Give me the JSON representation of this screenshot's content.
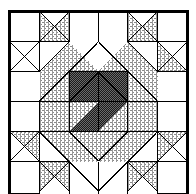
{
  "figure": {
    "kind": "quilt-block-diagram",
    "canvas": {
      "width": 196,
      "height": 194
    },
    "frame": {
      "x": 8,
      "y": 10,
      "width": 180,
      "height": 184,
      "stroke": "#000000",
      "stroke_width": 3
    },
    "grid": {
      "columns": 6,
      "rows": 6,
      "cell": 30,
      "origin_x": 9.5,
      "origin_y": 11.5
    },
    "palette": {
      "background": "#ffffff",
      "patch_white": "#ffffff",
      "patch_light": "#c9c9c9",
      "patch_dark": "#3a3a3a",
      "outline": "#000000"
    },
    "fill_names": {
      "white": "patch-white",
      "light": "patch-light-crosshatch",
      "dark": "patch-dark-checker"
    },
    "symmetry": "4-fold rotational about center",
    "patches": [
      {
        "name": "corner-square-top-left",
        "fill": "white",
        "points": "9.5,11.5 39.5,11.5 39.5,41.5 9.5,41.5"
      },
      {
        "name": "corner-square-top-right",
        "fill": "white",
        "points": "157.5,11.5 187.5,11.5 187.5,41.5 157.5,41.5"
      },
      {
        "name": "corner-square-bottom-left",
        "fill": "white",
        "points": "9.5,161.5 39.5,161.5 39.5,193.5 9.5,193.5"
      },
      {
        "name": "corner-square-bottom-right",
        "fill": "white",
        "points": "157.5,161.5 187.5,161.5 187.5,193.5 157.5,193.5"
      },
      {
        "name": "top-notch-light-left",
        "fill": "light",
        "points": "39.5,11.5 69.5,11.5 39.5,41.5"
      },
      {
        "name": "top-notch-light-right",
        "fill": "light",
        "points": "98.5,11.5 127.5,11.5 127.5,41.5"
      },
      {
        "name": "top-band-light-left",
        "fill": "light",
        "points": "39.5,41.5 69.5,11.5 69.5,41.5"
      },
      {
        "name": "top-band-light-right",
        "fill": "light",
        "points": "98.5,11.5 98.5,41.5 127.5,41.5"
      },
      {
        "name": "left-notch-light-upper",
        "fill": "light",
        "points": "9.5,41.5 39.5,41.5 9.5,71.5"
      },
      {
        "name": "left-notch-light-lower",
        "fill": "light",
        "points": "9.5,71.5 39.5,71.5 39.5,41.5"
      },
      {
        "name": "right-notch-light-upper",
        "fill": "light",
        "points": "157.5,41.5 187.5,41.5 187.5,71.5"
      },
      {
        "name": "right-notch-light-lower",
        "fill": "light",
        "points": "157.5,41.5 157.5,71.5 187.5,71.5"
      },
      {
        "name": "diagonal-light-top-left",
        "fill": "light",
        "points": "39.5,71.5 69.5,41.5 98.5,41.5 98.5,71.5 69.5,101.5 39.5,101.5"
      },
      {
        "name": "diagonal-light-top-right",
        "fill": "light",
        "points": "98.5,41.5 127.5,41.5 157.5,71.5 157.5,101.5 127.5,101.5 98.5,71.5"
      },
      {
        "name": "diagonal-light-bottom-left",
        "fill": "light",
        "points": "39.5,101.5 69.5,101.5 98.5,131.5 98.5,161.5 69.5,161.5 39.5,131.5"
      },
      {
        "name": "diagonal-light-bottom-right",
        "fill": "light",
        "points": "98.5,131.5 127.5,101.5 157.5,101.5 157.5,131.5 127.5,161.5 98.5,161.5"
      },
      {
        "name": "dark-triangle-top-left",
        "fill": "dark",
        "points": "69.5,41.5 98.5,41.5 98.5,71.5 69.5,71.5"
      },
      {
        "name": "dark-triangle-top-right",
        "fill": "dark",
        "points": "98.5,41.5 127.5,41.5 127.5,71.5 98.5,71.5"
      },
      {
        "name": "center-cross",
        "fill": "dark",
        "points": "69.5,71.5 127.5,71.5 127.5,131.5 69.5,131.5"
      },
      {
        "name": "bottom-notch-light-left",
        "fill": "light",
        "points": "39.5,161.5 69.5,161.5 39.5,191.5"
      },
      {
        "name": "bottom-notch-light-right",
        "fill": "light",
        "points": "127.5,161.5 157.5,161.5 157.5,191.5"
      }
    ],
    "outlines": [
      {
        "name": "frame-border"
      },
      {
        "name": "patch-seam-lines"
      }
    ]
  }
}
